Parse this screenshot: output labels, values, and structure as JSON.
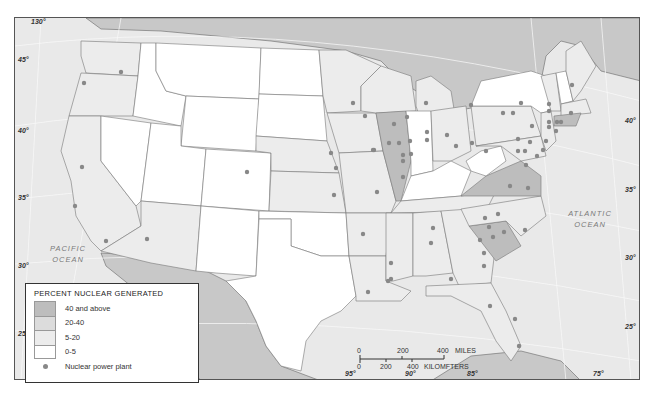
{
  "map": {
    "legend": {
      "title": "PERCENT NUCLEAR GENERATED",
      "items": [
        {
          "label": "40 and above",
          "color": "#bdbdbd"
        },
        {
          "label": "20-40",
          "color": "#dcdcdc"
        },
        {
          "label": "5-20",
          "color": "#ececec"
        },
        {
          "label": "0-5",
          "color": "#ffffff"
        }
      ],
      "plant_label": "Nuclear power plant",
      "plant_color": "#888888"
    },
    "oceans": {
      "pacific": "PACIFIC\nOCEAN",
      "atlantic": "ATLANTIC\nOCEAN"
    },
    "longitude_labels": [
      "120°",
      "115°",
      "110°",
      "95°",
      "90°",
      "85°",
      "75°"
    ],
    "top_longitude_label": "130°",
    "latitude_labels_left": [
      "45°",
      "40°",
      "35°",
      "30°",
      "25°"
    ],
    "latitude_labels_right": [
      "40°",
      "35°",
      "30°",
      "25°"
    ],
    "scale": {
      "miles_ticks": [
        "0",
        "200",
        "400"
      ],
      "miles_label": "MILES",
      "km_ticks": [
        "0",
        "200",
        "400"
      ],
      "km_label": "KILOMFTERS"
    }
  }
}
